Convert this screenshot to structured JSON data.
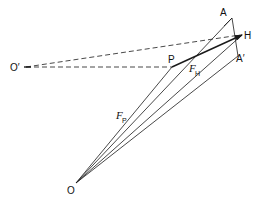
{
  "diagram": {
    "type": "vector-force-diagram",
    "points": {
      "O": {
        "label": "O",
        "x": 76,
        "y": 183
      },
      "O_prime": {
        "label": "O′",
        "x": 24,
        "y": 67
      },
      "P": {
        "label": "P",
        "x": 172,
        "y": 67
      },
      "A": {
        "label": "A",
        "x": 232,
        "y": 18
      },
      "H": {
        "label": "H",
        "x": 242,
        "y": 35
      },
      "A_prime": {
        "label": "A′",
        "x": 238,
        "y": 56
      }
    },
    "labels": {
      "O": "O",
      "O_prime": "O′",
      "P": "P",
      "A": "A",
      "H": "H",
      "A_prime": "A′",
      "F_H_main": "F",
      "F_H_sub": "H",
      "F_P_main": "F",
      "F_P_sub": "P"
    },
    "lines": [
      {
        "from": "O",
        "to": "P",
        "style": "solid"
      },
      {
        "from": "O",
        "to": "A",
        "style": "solid"
      },
      {
        "from": "O",
        "to": "H",
        "style": "solid"
      },
      {
        "from": "O",
        "to": "A_prime",
        "style": "solid"
      },
      {
        "from": "A",
        "to": "A_prime",
        "style": "solid"
      },
      {
        "from": "P",
        "to": "H",
        "style": "solid-bold-arrow"
      },
      {
        "from": "O_prime",
        "to": "P",
        "style": "dashed"
      },
      {
        "from": "O_prime",
        "to": "H",
        "style": "dashed"
      }
    ],
    "colors": {
      "stroke": "#1a1a1a",
      "background": "#ffffff"
    }
  }
}
